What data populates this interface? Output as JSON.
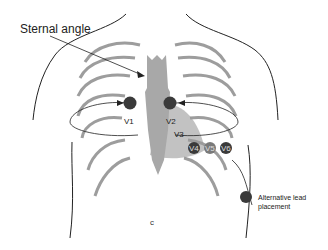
{
  "figure": {
    "title_label": "Sternal angle",
    "legend": {
      "marker_color": "#3a3a3a",
      "text": "Alternative lead placement"
    },
    "leads": [
      {
        "id": "V1",
        "label": "V1",
        "x": 131,
        "y": 126
      },
      {
        "id": "V2",
        "label": "V2",
        "x": 172,
        "y": 126
      },
      {
        "id": "V3",
        "label": "V3",
        "x": 180,
        "y": 139
      },
      {
        "id": "V4",
        "label": "V4",
        "x": 194,
        "y": 150,
        "style": "dark"
      },
      {
        "id": "V5",
        "label": "V5",
        "x": 210,
        "y": 150,
        "style": "medium"
      },
      {
        "id": "V6",
        "label": "V6",
        "x": 225,
        "y": 150,
        "style": "dark"
      }
    ],
    "alternative_leads": [
      {
        "id": "V1R",
        "label": "V1",
        "x": 130,
        "y": 103
      },
      {
        "id": "V2R",
        "label": "V2",
        "x": 170,
        "y": 103
      }
    ],
    "colors": {
      "sternum": "#a8a8a8",
      "heart": "#9a9a9a",
      "ribs": "#8c8c8c",
      "outline": "#222222",
      "lead_dark": "#3a3a3a",
      "lead_medium": "#7a7a7a"
    }
  }
}
